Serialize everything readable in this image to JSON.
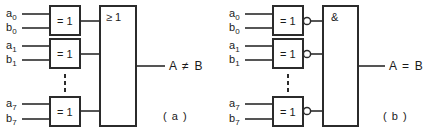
{
  "figure": {
    "panels": [
      {
        "id": "a",
        "caption": "( a )",
        "combiner_symbol": "≥ 1",
        "combiner_name": "or-gate",
        "output_label": "A ≠ B",
        "inverted_outputs": false,
        "stages": [
          {
            "gate_symbol": "= 1",
            "inputs": [
              {
                "name": "a",
                "index": "0"
              },
              {
                "name": "b",
                "index": "0"
              }
            ]
          },
          {
            "gate_symbol": "= 1",
            "inputs": [
              {
                "name": "a",
                "index": "1"
              },
              {
                "name": "b",
                "index": "1"
              }
            ]
          },
          {
            "gate_symbol": "= 1",
            "inputs": [
              {
                "name": "a",
                "index": "7"
              },
              {
                "name": "b",
                "index": "7"
              }
            ]
          }
        ],
        "ellipsis": "vertical-dots"
      },
      {
        "id": "b",
        "caption": "( b )",
        "combiner_symbol": "&",
        "combiner_name": "and-gate",
        "output_label": "A = B",
        "inverted_outputs": true,
        "stages": [
          {
            "gate_symbol": "= 1",
            "inputs": [
              {
                "name": "a",
                "index": "0"
              },
              {
                "name": "b",
                "index": "0"
              }
            ]
          },
          {
            "gate_symbol": "= 1",
            "inputs": [
              {
                "name": "a",
                "index": "1"
              },
              {
                "name": "b",
                "index": "1"
              }
            ]
          },
          {
            "gate_symbol": "= 1",
            "inputs": [
              {
                "name": "a",
                "index": "7"
              },
              {
                "name": "b",
                "index": "7"
              }
            ]
          }
        ],
        "ellipsis": "vertical-dots"
      }
    ],
    "colors": {
      "line": "#2b2b2b",
      "text": "#1a1a1a",
      "background": "#ffffff"
    }
  }
}
